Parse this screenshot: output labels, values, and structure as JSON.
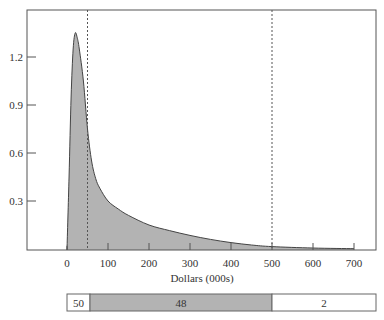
{
  "chart_data": {
    "type": "area",
    "title": "",
    "xlabel": "Dollars (000s)",
    "ylabel": "",
    "xlim": [
      -100,
      750
    ],
    "ylim": [
      0,
      1.45
    ],
    "grid": false,
    "legend": null,
    "x_ticks": [
      0,
      100,
      200,
      300,
      400,
      500,
      600,
      700
    ],
    "x_tick_labels": [
      "0",
      "100",
      "200",
      "300",
      "400",
      "500",
      "600",
      "700"
    ],
    "y_ticks": [
      0.3,
      0.6,
      0.9,
      1.2
    ],
    "y_tick_labels": [
      "0.3",
      "0.6",
      "0.9",
      "1.2"
    ],
    "series": [
      {
        "name": "density",
        "x": [
          0,
          5,
          10,
          15,
          20,
          25,
          30,
          40,
          50,
          60,
          70,
          80,
          100,
          125,
          150,
          200,
          250,
          300,
          350,
          400,
          450,
          500,
          600,
          700
        ],
        "values": [
          0,
          0.45,
          0.95,
          1.25,
          1.35,
          1.32,
          1.25,
          1.05,
          0.75,
          0.55,
          0.44,
          0.38,
          0.3,
          0.25,
          0.21,
          0.15,
          0.115,
          0.085,
          0.06,
          0.04,
          0.025,
          0.015,
          0.006,
          0.002
        ]
      }
    ],
    "annotations": [
      {
        "type": "vline",
        "x": 50,
        "style": "dashed"
      },
      {
        "type": "vline",
        "x": 500,
        "style": "dashed"
      }
    ],
    "segment_bar": {
      "segments": [
        {
          "label": "50",
          "from": 0,
          "to": 50,
          "fill": "#ffffff"
        },
        {
          "label": "48",
          "from": 50,
          "to": 500,
          "fill": "#b3b3b3"
        },
        {
          "label": "2",
          "from": 500,
          "to": 750,
          "fill": "#ffffff"
        }
      ]
    }
  },
  "colors": {
    "fill": "#b3b3b3",
    "line": "#444444",
    "axis": "#555555",
    "background": "#ffffff"
  }
}
